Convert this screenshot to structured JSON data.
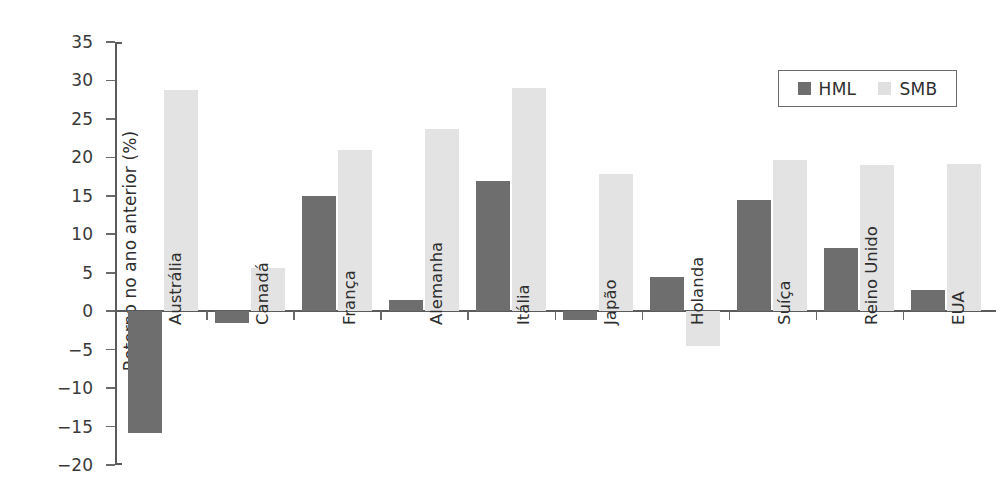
{
  "chart_data": {
    "type": "bar",
    "title": "",
    "subtitle": "",
    "xlabel": "",
    "ylabel": "Retorno no ano anterior (%)",
    "ylim": [
      -20,
      35
    ],
    "ytick_step": 5,
    "yticks": [
      35,
      30,
      25,
      20,
      15,
      10,
      5,
      0,
      -5,
      -10,
      -15,
      -20
    ],
    "ytick_labels": [
      "35",
      "30",
      "25",
      "20",
      "15",
      "10",
      "5",
      "0",
      "−5",
      "−10",
      "−15",
      "−20"
    ],
    "grid": false,
    "legend_position": "top-right",
    "categories": [
      "Austrália",
      "Canadá",
      "França",
      "Alemanha",
      "Itália",
      "Japão",
      "Holanda",
      "Suíça",
      "Reino Unido",
      "EUA"
    ],
    "series": [
      {
        "name": "HML",
        "color": "#6e6e6e",
        "values": [
          -15.8,
          -1.6,
          15.0,
          1.5,
          16.9,
          -1.2,
          4.5,
          14.5,
          8.2,
          2.8
        ]
      },
      {
        "name": "SMB",
        "color": "#e3e3e3",
        "values": [
          28.7,
          5.6,
          21.0,
          23.7,
          29.0,
          17.8,
          -4.5,
          19.6,
          19.0,
          19.1
        ]
      }
    ]
  },
  "legend": {
    "entries": [
      {
        "label": "HML",
        "swatch": "hml"
      },
      {
        "label": "SMB",
        "swatch": "smb"
      }
    ]
  },
  "colors": {
    "hml": "#6e6e6e",
    "smb": "#e3e3e3",
    "axis": "#5b5b5b",
    "text": "#2f2f2f",
    "background": "#ffffff"
  }
}
